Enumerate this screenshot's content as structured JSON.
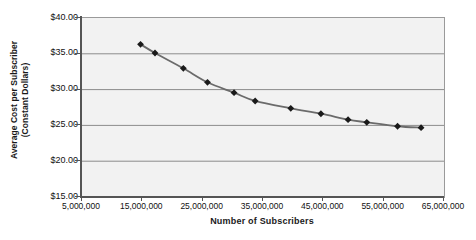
{
  "chart_data": {
    "type": "line",
    "title": "",
    "xlabel": "Number of Subscribers",
    "ylabel": "Average Cost per Subscriber (Constant Dollars)",
    "ylabel_line1": "Average Cost per Subscriber",
    "ylabel_line2": "(Constant Dollars)",
    "xlim": [
      5000000,
      65000000
    ],
    "ylim": [
      15.0,
      40.0
    ],
    "grid": "horizontal",
    "legend": "none",
    "marker": "diamond",
    "marker_color": "#1a1a1a",
    "line_color": "#6b6b6b",
    "plot_background": "#f2f2f2",
    "gridline_color": "#8c8c8c",
    "x_tick_labels": [
      "5,000,000",
      "15,000,000",
      "25,000,000",
      "35,000,000",
      "45,000,000",
      "55,000,000",
      "65,000,000"
    ],
    "x_tick_values": [
      5000000,
      15000000,
      25000000,
      35000000,
      45000000,
      55000000,
      65000000
    ],
    "y_tick_labels": [
      "$40.00",
      "$35.00",
      "$30.00",
      "$25.00",
      "$20.00",
      "$15.00"
    ],
    "y_tick_values": [
      40.0,
      35.0,
      30.0,
      25.0,
      20.0,
      15.0
    ],
    "x": [
      14700000,
      17100000,
      21800000,
      25800000,
      30200000,
      33700000,
      39600000,
      44600000,
      49100000,
      52200000,
      57300000,
      61200000
    ],
    "y": [
      36.33,
      35.11,
      32.97,
      31.02,
      29.57,
      28.41,
      27.38,
      26.63,
      25.8,
      25.43,
      24.88,
      24.68
    ],
    "points": [
      {
        "x": 14700000,
        "y": 36.33
      },
      {
        "x": 17100000,
        "y": 35.11
      },
      {
        "x": 21800000,
        "y": 32.97
      },
      {
        "x": 25800000,
        "y": 31.02
      },
      {
        "x": 30200000,
        "y": 29.57
      },
      {
        "x": 33700000,
        "y": 28.41
      },
      {
        "x": 39600000,
        "y": 27.38
      },
      {
        "x": 44600000,
        "y": 26.63
      },
      {
        "x": 49100000,
        "y": 25.8
      },
      {
        "x": 52200000,
        "y": 25.43
      },
      {
        "x": 57300000,
        "y": 24.88
      },
      {
        "x": 61200000,
        "y": 24.68
      }
    ]
  }
}
